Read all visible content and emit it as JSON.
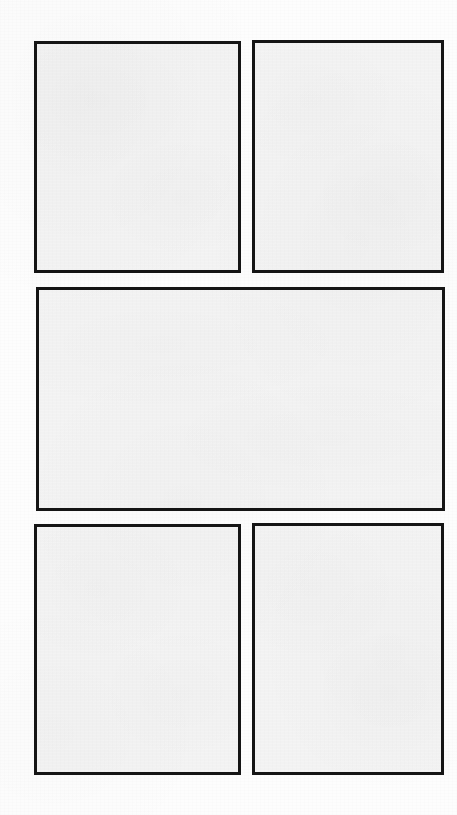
{
  "document": {
    "kind": "scanned-page",
    "title": "",
    "background_color": "#fdfdfd",
    "page_width": 457,
    "page_height": 815
  },
  "layout": {
    "description": "",
    "rows": 3,
    "border_color": "#151515",
    "panel_fill_color": "#f4f4f4",
    "border_width_px": 3
  },
  "panels": [
    {
      "id": "top-left",
      "label": "",
      "content": "",
      "row": 1,
      "column": 1,
      "shape": "rectangle",
      "x": 34,
      "y": 41,
      "width": 207,
      "height": 232
    },
    {
      "id": "top-right",
      "label": "",
      "content": "",
      "row": 1,
      "column": 2,
      "shape": "rectangle",
      "x": 252,
      "y": 40,
      "width": 192,
      "height": 233
    },
    {
      "id": "middle-wide",
      "label": "",
      "content": "",
      "row": 2,
      "column": 1,
      "shape": "rectangle",
      "x": 36,
      "y": 287,
      "width": 409,
      "height": 224
    },
    {
      "id": "bottom-left",
      "label": "",
      "content": "",
      "row": 3,
      "column": 1,
      "shape": "rectangle",
      "x": 34,
      "y": 524,
      "width": 207,
      "height": 251
    },
    {
      "id": "bottom-right",
      "label": "",
      "content": "",
      "row": 3,
      "column": 2,
      "shape": "rectangle",
      "x": 252,
      "y": 523,
      "width": 192,
      "height": 252
    }
  ]
}
